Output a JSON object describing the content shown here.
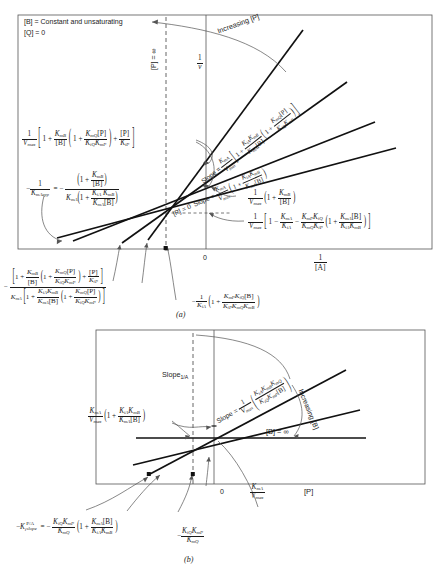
{
  "figure": {
    "panel_a_label": "(a)",
    "panel_b_label": "(b)"
  },
  "panel_a": {
    "conditions": {
      "line1": "[B] = Constant and unsaturating",
      "line2": "[Q] = 0"
    },
    "y_axis_label": "1/v",
    "x_axis_label": "1/[A]",
    "origin_label": "0",
    "dashed_line_label": "[P] = ∞",
    "increasing_label": "Increasing [P]",
    "zero_line_label": "[P] = 0",
    "slope_word": "Slope",
    "equals": "=",
    "slope_top": {
      "prefix": "Slope =",
      "coefficient_num": "K",
      "coefficient_num_sub": "mA",
      "coefficient_den": "V",
      "coefficient_den_sub": "max",
      "bracket_open": "[",
      "term_one": "1 +",
      "inner_num": "K",
      "inner_num_sub": "iA",
      "inner_num2": "K",
      "inner_num2_sub": "mB",
      "inner_den": "K",
      "inner_den_sub": "mA",
      "inner_den_conc": "[B]",
      "paren_term_one": "1 +",
      "paren_num": "K",
      "paren_num_sub": "mQ",
      "paren_num_conc": "[P]",
      "paren_den": "K",
      "paren_den_sub": "iQ",
      "paren_den2": "K",
      "paren_den2_sub": "mP",
      "bracket_close": "]"
    },
    "slope_bottom": {
      "prefix": "Slope =",
      "coefficient_num": "K",
      "coefficient_num_sub": "mA",
      "coefficient_den": "V",
      "coefficient_den_sub": "max",
      "term_one": "1 +",
      "inner_num": "K",
      "inner_num_sub": "iA",
      "inner_num2": "K",
      "inner_num2_sub": "mB",
      "inner_den": "K",
      "inner_den_sub": "mA",
      "inner_den_conc": "[B]"
    },
    "intercept_expression": {
      "lead_num": "1",
      "lead_den": "V",
      "lead_den_sub": "max",
      "t1": "1 +",
      "f1_num": "K",
      "f1_num_sub": "mB",
      "f1_den": "[B]",
      "t2": "1 +",
      "f2_num": "K",
      "f2_num_sub": "mQ",
      "f2_num_conc": "[P]",
      "f2_den": "K",
      "f2_den_sub": "iQ",
      "f2_den2": "K",
      "f2_den2_sub": "mP",
      "t3": "+",
      "f3_num": "[P]",
      "f3_den": "K",
      "f3_den_sub": "iP"
    },
    "x_intercept_expression": {
      "lhs_minus": "−",
      "lhs_num": "1",
      "lhs_den": "K",
      "lhs_den_sub": "mA",
      "lhs_den_sub2": "app",
      "equals": "= −",
      "num_t1": "1 +",
      "num_f_num": "K",
      "num_f_num_sub": "mB",
      "num_f_den": "[B]",
      "den_k": "K",
      "den_k_sub": "mA",
      "den_t1": "1 +",
      "den_f_num": "K",
      "den_f_num_sub": "iA",
      "den_f_num2": "K",
      "den_f_num2_sub": "mB",
      "den_f_den": "K",
      "den_f_den_sub": "mA",
      "den_f_den_conc": "[B]"
    },
    "upper_intercept_label": {
      "lead_num": "1",
      "lead_den": "V",
      "lead_den_sub": "max",
      "t1": "1 +",
      "f_num": "K",
      "f_num_sub": "mB",
      "f_den": "[B]"
    },
    "crossover_label": {
      "lead_num": "1",
      "lead_den": "V",
      "lead_den_sub": "max",
      "t1": "1 −",
      "f1_num": "K",
      "f1_num_sub": "mA",
      "f1_den": "K",
      "f1_den_sub": "iA",
      "t2": "−",
      "f2_num": "K",
      "f2_num_sub": "mP",
      "f2_num2": "K",
      "f2_num2_sub": "iQ",
      "f2_den": "K",
      "f2_den_sub": "mQ",
      "f2_den2": "K",
      "f2_den2_sub": "iP",
      "t3": "1 +",
      "f3_num": "K",
      "f3_num_sub": "mA",
      "f3_num_conc": "[B]",
      "f3_den": "K",
      "f3_den_sub": "iA",
      "f3_den2": "K",
      "f3_den2_sub": "mB"
    },
    "bottom_left_expression": {
      "minus": "−",
      "num_t1": "1 +",
      "num_f1_num": "K",
      "num_f1_num_sub": "mB",
      "num_f1_den": "[B]",
      "num_t2": "1 +",
      "num_f2_num": "K",
      "num_f2_num_sub": "mQ",
      "num_f2_num_conc": "[P]",
      "num_f2_den": "K",
      "num_f2_den_sub": "iQ",
      "num_f2_den2": "K",
      "num_f2_den2_sub": "mP",
      "num_t3": "+",
      "num_f3_num": "[P]",
      "num_f3_den": "K",
      "num_f3_den_sub": "iP",
      "den_k": "K",
      "den_k_sub": "mA",
      "den_t1": "1 +",
      "den_f1_num": "K",
      "den_f1_num_sub": "iA",
      "den_f1_num2": "K",
      "den_f1_num2_sub": "mB",
      "den_f1_den": "K",
      "den_f1_den_sub": "mA",
      "den_f1_den_conc": "[B]",
      "den_t2": "1 +",
      "den_f2_num": "K",
      "den_f2_num_sub": "mQ",
      "den_f2_num_conc": "[P]",
      "den_f2_den": "K",
      "den_f2_den_sub": "iQ",
      "den_f2_den2": "K",
      "den_f2_den2_sub": "mP"
    },
    "bottom_right_expression": {
      "minus": "−",
      "lead_num": "1",
      "lead_den": "K",
      "lead_den_sub": "iA",
      "t1": "1 +",
      "f_num": "K",
      "f_num_sub": "mP",
      "f_num2": "K",
      "f_num2_sub": "iQ",
      "f_num_conc": "[B]",
      "f_den": "K",
      "f_den_sub": "iP",
      "f_den2": "K",
      "f_den2_sub": "mQ",
      "f_den3": "K",
      "f_den3_sub": "mB"
    }
  },
  "panel_b": {
    "y_axis_label": "Slope",
    "y_axis_label_sub": "1/A",
    "x_axis_label": "[P]",
    "origin_label": "0",
    "asymptote_label": "[B] = ∞",
    "increasing_label": "Increasing [B]",
    "slope_expression": {
      "prefix": "Slope =",
      "lead_num": "1",
      "lead_den": "V",
      "lead_den_sub": "max",
      "f_num": "K",
      "f_num_sub": "iA",
      "f_num2": "K",
      "f_num2_sub": "mB",
      "f_num3": "K",
      "f_num3_sub": "mQ",
      "f_den": "K",
      "f_den_sub": "iQ",
      "f_den2": "K",
      "f_den2_sub": "mP",
      "f_den_conc": "[B]"
    },
    "left_intercept_label": {
      "lead_num": "K",
      "lead_num_sub": "mA",
      "lead_den": "V",
      "lead_den_sub": "max",
      "t1": "1 +",
      "f_num": "K",
      "f_num_sub": "iA",
      "f_num2": "K",
      "f_num2_sub": "mB",
      "f_den": "K",
      "f_den_sub": "mA",
      "f_den_conc": "[B]"
    },
    "y_intercept_label": {
      "num": "K",
      "num_sub": "mA",
      "den": "V",
      "den_sub": "max"
    },
    "ki_slope_expression": {
      "lhs_minus": "−",
      "lhs_k": "K",
      "lhs_sub": "i",
      "lhs_sub_word": "slope",
      "lhs_sup": "P/A",
      "equals": "= −",
      "f_num": "K",
      "f_num_sub": "iQ",
      "f_num2": "K",
      "f_num2_sub": "mP",
      "f_den": "K",
      "f_den_sub": "mQ",
      "t1": "1 +",
      "g_num": "K",
      "g_num_sub": "mA",
      "g_num_conc": "[B]",
      "g_den": "K",
      "g_den_sub": "iA",
      "g_den2": "K",
      "g_den2_sub": "mB"
    },
    "ki_simple_expression": {
      "minus": "−",
      "num": "K",
      "num_sub": "iQ",
      "num2": "K",
      "num2_sub": "mP",
      "den": "K",
      "den_sub": "mQ"
    }
  }
}
